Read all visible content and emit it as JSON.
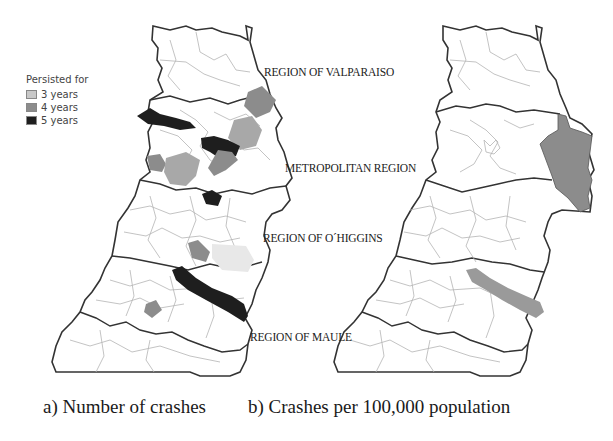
{
  "figure": {
    "legend": {
      "title": "Persisted for",
      "items": [
        {
          "label": "3 years",
          "color": "#c8c8c8"
        },
        {
          "label": "4 years",
          "color": "#8c8c8c"
        },
        {
          "label": "5 years",
          "color": "#1e1e1e"
        }
      ]
    },
    "region_labels": [
      "REGION OF VALPARAISO",
      "METROPOLITAN REGION",
      "REGION OF O´HIGGINS",
      "REGION OF MAULE"
    ],
    "panels": [
      {
        "id": "a",
        "caption": "a) Number of crashes"
      },
      {
        "id": "b",
        "caption": "b) Crashes per 100,000 population"
      }
    ],
    "colors": {
      "outline": "#333333",
      "commune_border": "#b4b4b4",
      "fill_3_years": "#c8c8c8",
      "fill_4_years": "#8c8c8c",
      "fill_5_years": "#1e1e1e"
    }
  }
}
